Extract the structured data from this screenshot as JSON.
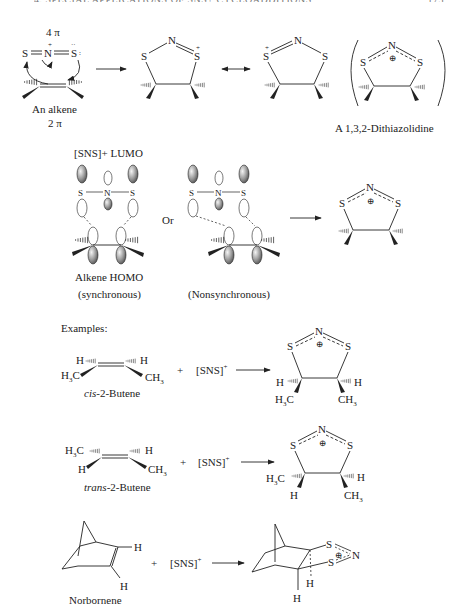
{
  "header": {
    "running_header": "4. SPECIAL APPLICATIONS OF SNS+ CYCLOADDITIONS",
    "page_number": "175"
  },
  "mechanism": {
    "electrons_top": "4 π",
    "electrons_bottom": "2 π",
    "alkene_label": "An alkene",
    "sns_atoms": [
      "S",
      "N",
      "S"
    ],
    "product_label": "A 1,3,2-Dithiazolidine"
  },
  "orbitals": {
    "lumo_label": "[SNS]+ LUMO",
    "or_label": "Or",
    "homo_label": "Alkene HOMO",
    "sync_label": "(synchronous)",
    "nonsync_label": "(Nonsynchronous)"
  },
  "examples": {
    "heading": "Examples:",
    "reagent": "[SNS]+",
    "plus": "+",
    "items": [
      {
        "name_italic": "cis",
        "name_rest": "-2-Butene"
      },
      {
        "name_italic": "trans",
        "name_rest": "-2-Butene"
      },
      {
        "name_italic": "",
        "name_rest": "Norbornene"
      }
    ]
  },
  "atoms": {
    "S": "S",
    "N": "N",
    "H": "H",
    "H3C": "H3C",
    "CH3": "CH3",
    "plus_charge": "+",
    "circled_plus": "⊕"
  },
  "colors": {
    "ink": "#222222",
    "lobe_fill": "#9a9a9a",
    "background": "#ffffff"
  }
}
